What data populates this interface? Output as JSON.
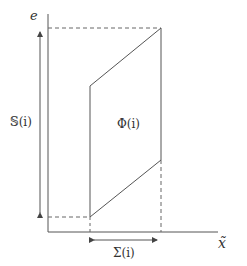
{
  "diagram": {
    "axes": {
      "y_label": "e",
      "x_label": "x̃"
    },
    "labels": {
      "vertical_span": "𝕊(i)",
      "region": "Φ(i)",
      "horizontal_span": "Σ(i)"
    },
    "colors": {
      "line": "#555555",
      "text": "#333333",
      "background": "#ffffff"
    }
  }
}
